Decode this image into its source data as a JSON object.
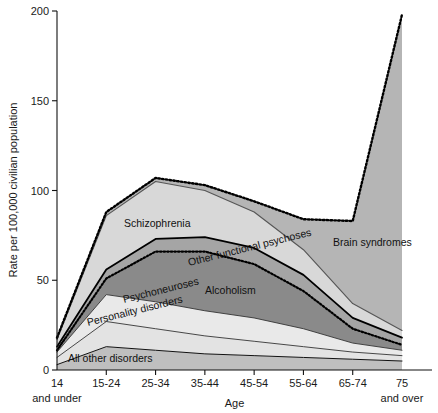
{
  "chart_data": {
    "type": "area",
    "stacked": true,
    "title": "",
    "xlabel": "Age",
    "ylabel": "Rate per 100,000 civilian population",
    "categories": [
      "14 and under",
      "15-24",
      "25-34",
      "35-44",
      "45-54",
      "55-64",
      "65-74",
      "75 and over"
    ],
    "category_lines": [
      [
        "14",
        "and under"
      ],
      [
        "15-24",
        ""
      ],
      [
        "25-34",
        ""
      ],
      [
        "35-44",
        ""
      ],
      [
        "45-54",
        ""
      ],
      [
        "55-64",
        ""
      ],
      [
        "65-74",
        ""
      ],
      [
        "75",
        "and over"
      ]
    ],
    "ylim": [
      0,
      200
    ],
    "yticks": [
      0,
      50,
      100,
      150,
      200
    ],
    "ytick_labels": [
      "0",
      "50",
      "100",
      "150",
      "200"
    ],
    "grid": false,
    "legend": "inline-labels",
    "series": [
      {
        "name": "All other disorders",
        "label": "All other disorders",
        "color": "#bfbfbf",
        "values": [
          3,
          13,
          11,
          9,
          8,
          7,
          6,
          5
        ]
      },
      {
        "name": "Personality disorders",
        "label": "Personality disorders",
        "color": "#e3e3e3",
        "values": [
          4,
          14,
          12,
          10,
          8,
          6,
          4,
          3
        ]
      },
      {
        "name": "Psychoneuroses",
        "label": "Psychoneuroses",
        "color": "#e9e9e9",
        "values": [
          3,
          15,
          15,
          14,
          13,
          10,
          5,
          3
        ]
      },
      {
        "name": "Alcoholism",
        "label": "Alcoholism",
        "color": "#8a8a8a",
        "values": [
          1,
          9,
          28,
          33,
          30,
          21,
          8,
          3
        ]
      },
      {
        "name": "Other functional psychoses",
        "label": "Other functional psychoses",
        "color": "#a5a5a5",
        "values": [
          2,
          5,
          7,
          8,
          9,
          9,
          6,
          4
        ]
      },
      {
        "name": "Schizophrenia",
        "label": "Schizophrenia",
        "color": "#d8d8d8",
        "values": [
          4,
          30,
          32,
          26,
          20,
          14,
          8,
          4
        ]
      },
      {
        "name": "Brain syndromes",
        "label": "Brain syndromes",
        "color": "#b5b5b5",
        "values": [
          1,
          2,
          2,
          3,
          6,
          17,
          46,
          176
        ]
      }
    ],
    "totals": [
      18,
      88,
      107,
      103,
      94,
      84,
      83,
      198
    ],
    "annotations": [
      {
        "text": "Schizophrenia",
        "x": 124,
        "y": 227
      },
      {
        "text": "Other functional psychoses",
        "x": 189,
        "y": 266,
        "rotate": -14
      },
      {
        "text": "Alcoholism",
        "x": 205,
        "y": 294
      },
      {
        "text": "Psychoneuroses",
        "x": 124,
        "y": 303,
        "rotate": -14
      },
      {
        "text": "Personality disorders",
        "x": 88,
        "y": 326,
        "rotate": -14
      },
      {
        "text": "All other disorders",
        "x": 68,
        "y": 362
      },
      {
        "text": "Brain syndromes",
        "x": 333,
        "y": 246
      }
    ]
  }
}
